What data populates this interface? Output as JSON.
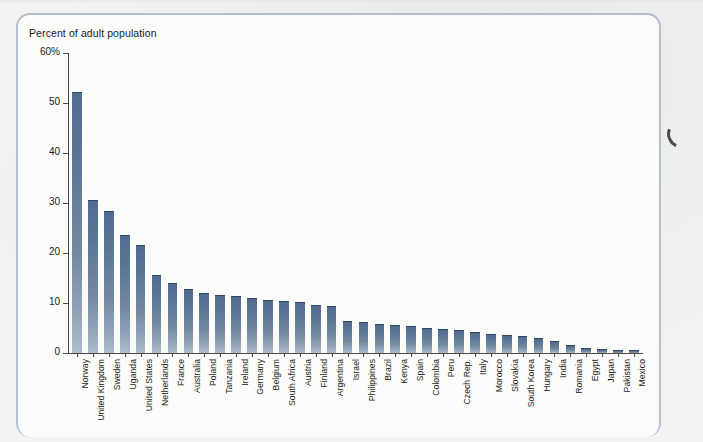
{
  "figure": {
    "axis_title": "Percent of adult population",
    "bar_color": "#5c7697",
    "frame_color": "#b6c0d2",
    "axis_color": "#4a4a4a"
  },
  "chart_data": {
    "type": "bar",
    "title": "Percent of adult population",
    "xlabel": "",
    "ylabel": "Percent of adult population",
    "ylim": [
      0,
      60
    ],
    "yticks": [
      "0",
      "10",
      "20",
      "30",
      "40",
      "50",
      "60%"
    ],
    "ytick_values": [
      0,
      10,
      20,
      30,
      40,
      50,
      60
    ],
    "grid": false,
    "legend": "none",
    "categories": [
      "Norway",
      "United Kingdom",
      "Sweden",
      "Uganda",
      "United States",
      "Netherlands",
      "France",
      "Australia",
      "Poland",
      "Tanzania",
      "Ireland",
      "Germany",
      "Belgium",
      "South Africa",
      "Austria",
      "Finland",
      "Argentina",
      "Israel",
      "Philippines",
      "Brazil",
      "Kenya",
      "Spain",
      "Colombia",
      "Peru",
      "Czech Rep.",
      "Italy",
      "Morocco",
      "Slovakia",
      "South Korea",
      "Hungary",
      "India",
      "Romania",
      "Egypt",
      "Japan",
      "Pakistan",
      "Mexico"
    ],
    "values": [
      52.0,
      30.4,
      28.2,
      23.5,
      21.4,
      15.4,
      13.9,
      12.7,
      11.9,
      11.4,
      11.2,
      10.8,
      10.4,
      10.3,
      10.1,
      9.5,
      9.2,
      6.2,
      6.0,
      5.7,
      5.5,
      5.2,
      4.8,
      4.6,
      4.4,
      4.0,
      3.7,
      3.4,
      3.2,
      2.9,
      2.2,
      1.5,
      0.8,
      0.7,
      0.5,
      0.4
    ]
  }
}
